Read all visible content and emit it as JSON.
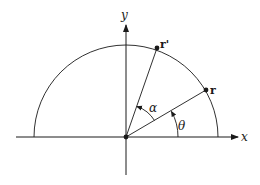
{
  "diagram": {
    "type": "geometry-rotation",
    "axes": {
      "x_label": "x",
      "y_label": "y"
    },
    "points": {
      "r": {
        "label": "r",
        "angle_deg": 29
      },
      "r_prime": {
        "label": "r'",
        "angle_deg": 69
      }
    },
    "angles": {
      "theta": {
        "label": "θ",
        "from": "x-axis",
        "to": "r"
      },
      "alpha": {
        "label": "α",
        "from": "r",
        "to": "r'"
      }
    },
    "shape": "upper semicircle centered at origin",
    "colors": {
      "stroke": "#1a1a1a",
      "background": "#ffffff"
    }
  }
}
